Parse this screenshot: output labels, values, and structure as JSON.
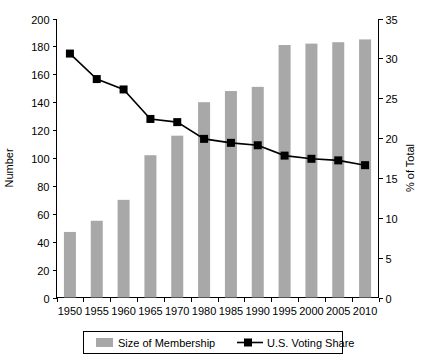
{
  "chart_data": {
    "type": "bar",
    "title": "",
    "subtitle": "",
    "xlabel": "",
    "ylabel": "Number",
    "y2label": "% of Total",
    "categories": [
      "1950",
      "1955",
      "1960",
      "1965",
      "1970",
      "1980",
      "1985",
      "1990",
      "1995",
      "2000",
      "2005",
      "2010"
    ],
    "ylim": [
      0,
      200
    ],
    "y2lim": [
      0,
      35
    ],
    "yticks": [
      0,
      20,
      40,
      60,
      80,
      100,
      120,
      140,
      160,
      180,
      200
    ],
    "y2ticks": [
      0,
      5,
      10,
      15,
      20,
      25,
      30,
      35
    ],
    "grid": false,
    "legend_position": "bottom",
    "series": [
      {
        "name": "Size of Membership",
        "type": "bar",
        "axis": "left",
        "color": "#a8a8a8",
        "values": [
          47,
          55,
          70,
          102,
          116,
          140,
          148,
          151,
          181,
          182,
          183,
          185
        ]
      },
      {
        "name": "U.S. Voting Share",
        "type": "line",
        "axis": "right",
        "color": "#000000",
        "marker": "square",
        "values": [
          30.6,
          27.4,
          26.1,
          22.4,
          22.0,
          19.9,
          19.4,
          19.1,
          17.8,
          17.4,
          17.2,
          16.6
        ]
      }
    ]
  },
  "legend": {
    "items": [
      {
        "label": "Size of Membership",
        "swatch": "bar-swatch",
        "color": "#a8a8a8"
      },
      {
        "label": "U.S. Voting Share",
        "swatch": "line-marker-swatch",
        "color": "#000000"
      }
    ]
  },
  "axes": {
    "left": {
      "title": "Number",
      "min": 0,
      "max": 200,
      "step": 20
    },
    "right": {
      "title": "% of Total",
      "min": 0,
      "max": 35,
      "step": 5
    },
    "bottom": {
      "title": ""
    }
  }
}
